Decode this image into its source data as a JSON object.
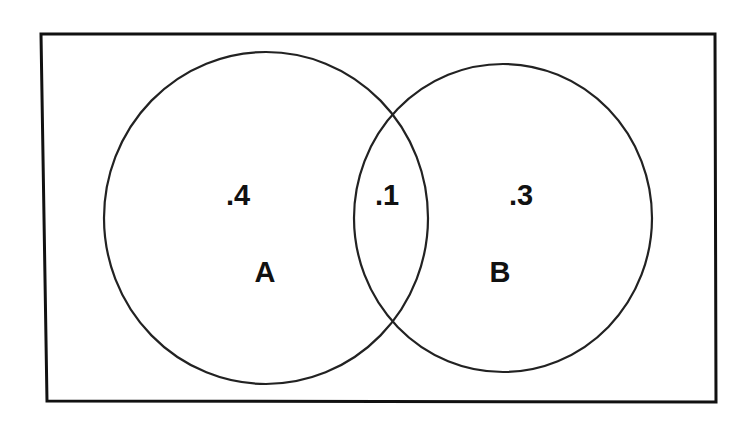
{
  "diagram": {
    "type": "venn",
    "universe": {
      "shape": "rectangle",
      "stroke": "#111111"
    },
    "sets": [
      {
        "name": "A",
        "label": "A",
        "only_value": ".4"
      },
      {
        "name": "B",
        "label": "B",
        "only_value": ".3"
      }
    ],
    "intersection": {
      "sets": [
        "A",
        "B"
      ],
      "value": ".1"
    },
    "labels": {
      "a_only": ".4",
      "intersection": ".1",
      "b_only": ".3",
      "set_a": "A",
      "set_b": "B"
    },
    "colors": {
      "stroke": "#111111",
      "background": "#ffffff",
      "text": "#111111"
    }
  }
}
